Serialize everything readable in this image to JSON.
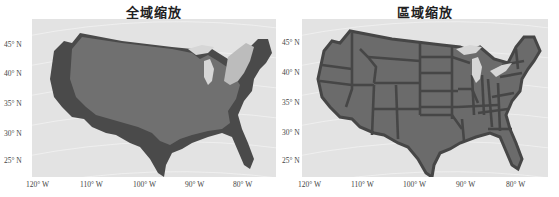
{
  "panels": [
    {
      "title": "全域缩放",
      "mode": "global-scaling",
      "colors": {
        "background": "#e3e3e3",
        "dark": "#4a4a4a",
        "mid": "#707070",
        "light": "#bcbcbc",
        "grid": "#f4f4f4"
      }
    },
    {
      "title": "區域缩放",
      "mode": "regional-scaling",
      "colors": {
        "background": "#e3e3e3",
        "fill": "#6b6b6b",
        "border": "#464646",
        "grid": "#f4f4f4"
      }
    }
  ],
  "axes": {
    "y_ticks": [
      "45° N",
      "40° N",
      "35° N",
      "30° N",
      "25° N"
    ],
    "x_ticks": [
      "120° W",
      "110° W",
      "100° W",
      "90° W",
      "80° W"
    ]
  }
}
